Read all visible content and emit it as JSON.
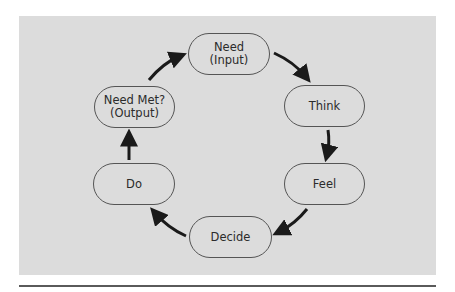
{
  "diagram": {
    "type": "cycle",
    "colors": {
      "background": "#dcdcdc",
      "node_border": "#555555",
      "text": "#2b2b2b",
      "arrow": "#1a1a1a",
      "rule": "#5a5a5a"
    },
    "nodes": [
      {
        "id": "need",
        "label": "Need\n(Input)"
      },
      {
        "id": "think",
        "label": "Think"
      },
      {
        "id": "feel",
        "label": "Feel"
      },
      {
        "id": "decide",
        "label": "Decide"
      },
      {
        "id": "do",
        "label": "Do"
      },
      {
        "id": "need-met",
        "label": "Need Met?\n(Output)"
      }
    ],
    "edges": [
      {
        "from": "need",
        "to": "think"
      },
      {
        "from": "think",
        "to": "feel"
      },
      {
        "from": "feel",
        "to": "decide"
      },
      {
        "from": "decide",
        "to": "do"
      },
      {
        "from": "do",
        "to": "need-met"
      },
      {
        "from": "need-met",
        "to": "need"
      }
    ]
  }
}
